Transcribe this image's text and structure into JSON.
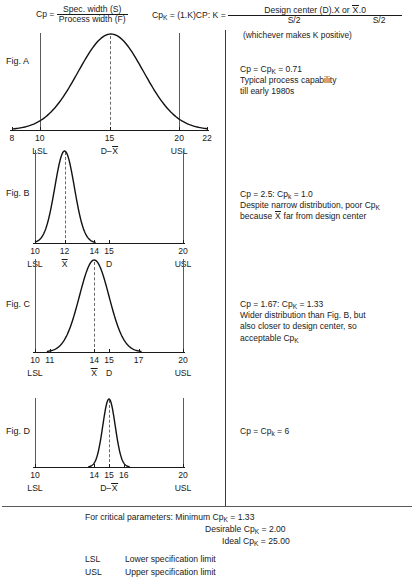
{
  "formulas": {
    "cp": {
      "lhs": "Cp =",
      "numerator": "Spec. width (S)",
      "denominator": "Process width (F)"
    },
    "cpk": {
      "lhs_a": "Cp",
      "lhs_sub": "K",
      "lhs_b": " = (1.K)C",
      "lhs_c": "P: K =",
      "num1": "Design center (D).X or ",
      "num1_over": "X",
      "num1_tail": ".0",
      "den1": "S/2",
      "den2": "S/2"
    },
    "note": "(whichever makes K positive)"
  },
  "figures": [
    {
      "label": "Fig. A",
      "axis": {
        "min": 8,
        "max": 22,
        "x_left": 12,
        "x_right": 207
      },
      "ticks": [
        {
          "value": "8",
          "pos": 8
        },
        {
          "value": "10",
          "pos": 10
        },
        {
          "value": "15",
          "pos": 15
        },
        {
          "value": "20",
          "pos": 20
        },
        {
          "value": "22",
          "pos": 22
        }
      ],
      "spec_labels": [
        {
          "text": "LSL",
          "pos": 10
        },
        {
          "text": "D–X",
          "pos": 15,
          "overbar": "X"
        },
        {
          "text": "USL",
          "pos": 20
        }
      ],
      "spec_lines": [
        10,
        20
      ],
      "center": 15,
      "curve": {
        "mean": 15.1,
        "sigma": 2.35,
        "half_width": 7.1
      }
    },
    {
      "label": "Fig. B",
      "axis": {
        "min": 10,
        "max": 20,
        "x_left": 35,
        "x_right": 183
      },
      "ticks": [
        {
          "value": "10",
          "pos": 10
        },
        {
          "value": "12",
          "pos": 12
        },
        {
          "value": "14",
          "pos": 14
        },
        {
          "value": "15",
          "pos": 15
        },
        {
          "value": "20",
          "pos": 20
        }
      ],
      "spec_labels": [
        {
          "text": "LSL",
          "pos": 10
        },
        {
          "text": "X",
          "pos": 12,
          "overbar": "X"
        },
        {
          "text": "D",
          "pos": 15
        },
        {
          "text": "USL",
          "pos": 20
        }
      ],
      "spec_lines": [
        10,
        20
      ],
      "center": 12,
      "curve": {
        "mean": 12.0,
        "sigma": 0.66,
        "half_width": 2.1
      }
    },
    {
      "label": "Fig. C",
      "axis": {
        "min": 10,
        "max": 20,
        "x_left": 35,
        "x_right": 183
      },
      "ticks": [
        {
          "value": "10",
          "pos": 10
        },
        {
          "value": "11",
          "pos": 11
        },
        {
          "value": "14",
          "pos": 14
        },
        {
          "value": "15",
          "pos": 15
        },
        {
          "value": "17",
          "pos": 17
        },
        {
          "value": "20",
          "pos": 20
        }
      ],
      "spec_labels": [
        {
          "text": "LSL",
          "pos": 10
        },
        {
          "text": "X",
          "pos": 14,
          "overbar": "X"
        },
        {
          "text": "D",
          "pos": 15
        },
        {
          "text": "USL",
          "pos": 20
        }
      ],
      "spec_lines": [
        10,
        20
      ],
      "center": 14,
      "curve": {
        "mean": 14.0,
        "sigma": 1.0,
        "half_width": 3.2
      }
    },
    {
      "label": "Fig. D",
      "axis": {
        "min": 10,
        "max": 20,
        "x_left": 35,
        "x_right": 183
      },
      "ticks": [
        {
          "value": "10",
          "pos": 10
        },
        {
          "value": "14",
          "pos": 14
        },
        {
          "value": "15",
          "pos": 15
        },
        {
          "value": "16",
          "pos": 16
        },
        {
          "value": "20",
          "pos": 20
        }
      ],
      "spec_labels": [
        {
          "text": "LSL",
          "pos": 10
        },
        {
          "text": "D–X",
          "pos": 15,
          "overbar": "X"
        },
        {
          "text": "USL",
          "pos": 20
        }
      ],
      "spec_lines": [
        10,
        20
      ],
      "center": 15,
      "curve": {
        "mean": 15.0,
        "sigma": 0.42,
        "half_width": 1.4
      }
    }
  ],
  "notes": [
    {
      "line1_a": "Cp = Cp",
      "line1_sub": "K",
      "line1_b": " = 0.71",
      "line2": "Typical process capability",
      "line3": "till early 1980s"
    },
    {
      "line1_a": "Cp = 2.5:  Cp",
      "line1_sub": "k",
      "line1_b": " = 1.0",
      "line2_a": "Despite narrow distribution, poor Cp",
      "line2_sub": "K",
      "line3_a": "because ",
      "line3_over": "X",
      "line3_b": " far from design center"
    },
    {
      "line1_a": "Cp = 1.67: Cp",
      "line1_sub": "K",
      "line1_b": " = 1.33",
      "line2": "Wider distribution than Fig. B, but",
      "line3": "also closer to design center, so",
      "line4_a": "acceptable Cp",
      "line4_sub": "K"
    },
    {
      "line1_a": "Cp = Cp",
      "line1_sub": "k",
      "line1_b": " = 6"
    }
  ],
  "summary": {
    "lead": "For critical parameters: Minimum Cp",
    "lead_sub": "K",
    "lead_val": " = 1.33",
    "line2": "Desirable Cp",
    "line2_sub": "K",
    "line2_val": " = 2.00",
    "line3": "Ideal Cp",
    "line3_sub": "K",
    "line3_val": " = 25.00",
    "legend": [
      {
        "abbr": "LSL",
        "text": "Lower specification limit"
      },
      {
        "abbr": "USL",
        "text": "Upper specification limit"
      }
    ]
  }
}
